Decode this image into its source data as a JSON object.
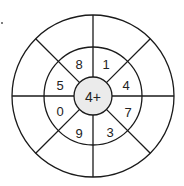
{
  "puzzle": {
    "center_label": "4+",
    "segments": [
      {
        "position": "top-left",
        "value": "8"
      },
      {
        "position": "top-right",
        "value": "1"
      },
      {
        "position": "right-upper",
        "value": "4"
      },
      {
        "position": "right-lower",
        "value": "7"
      },
      {
        "position": "bottom-right",
        "value": "3"
      },
      {
        "position": "bottom-left",
        "value": "9"
      },
      {
        "position": "left-lower",
        "value": "0"
      },
      {
        "position": "left-upper",
        "value": "5"
      }
    ],
    "outer_segments": [
      "",
      "",
      "",
      "",
      "",
      "",
      "",
      ""
    ]
  },
  "colors": {
    "stroke": "#1a1a1a",
    "center_fill": "#ebebeb",
    "background": "#ffffff"
  }
}
